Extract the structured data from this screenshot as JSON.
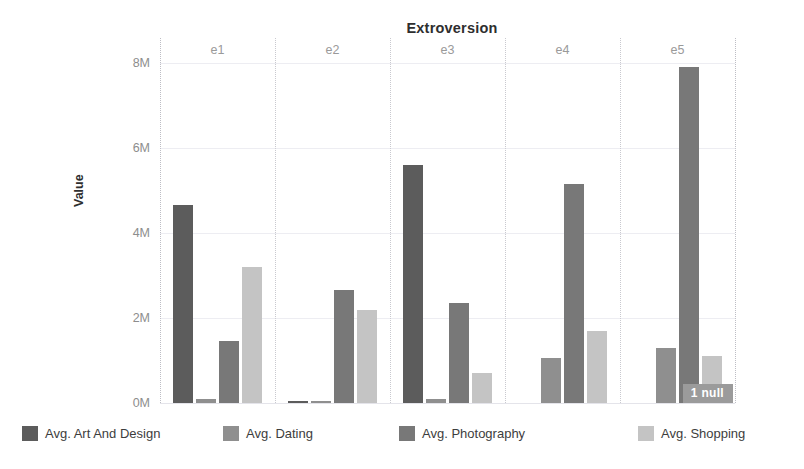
{
  "chart_data": {
    "type": "bar",
    "title": "Extroversion",
    "xlabel": "Extroversion",
    "ylabel": "Value",
    "categories": [
      "e1",
      "e2",
      "e3",
      "e4",
      "e5"
    ],
    "ylim": [
      0,
      8000000
    ],
    "yticks": [
      0,
      2000000,
      4000000,
      6000000,
      8000000
    ],
    "ytick_labels": [
      "0M",
      "2M",
      "4M",
      "6M",
      "8M"
    ],
    "grid": true,
    "legend_position": "bottom",
    "annotation": "1 null",
    "series": [
      {
        "name": "Avg. Art And Design",
        "color": "#5c5c5c",
        "values": [
          4650000,
          30000,
          5600000,
          0,
          0
        ]
      },
      {
        "name": "Avg. Dating",
        "color": "#8f8f8f",
        "values": [
          90000,
          30000,
          100000,
          1050000,
          1300000
        ]
      },
      {
        "name": "Avg. Photography",
        "color": "#787878",
        "values": [
          1450000,
          2650000,
          2350000,
          5150000,
          7900000
        ]
      },
      {
        "name": "Avg. Shopping",
        "color": "#c4c4c4",
        "values": [
          3200000,
          2200000,
          700000,
          1700000,
          1100000
        ]
      }
    ]
  },
  "legend": {
    "items": [
      {
        "label": "Avg. Art And Design",
        "color": "#5c5c5c"
      },
      {
        "label": "Avg. Dating",
        "color": "#8f8f8f"
      },
      {
        "label": "Avg. Photography",
        "color": "#787878"
      },
      {
        "label": "Avg. Shopping",
        "color": "#c4c4c4"
      }
    ]
  },
  "colors": {
    "gridline": "#ededf2",
    "separator": "#c9c9cf",
    "tick_text": "#8d8d8d",
    "title_text": "#2e2e2e",
    "badge_bg": "#9b9b9b",
    "badge_text": "#ffffff"
  }
}
